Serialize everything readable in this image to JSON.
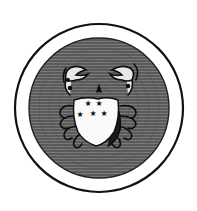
{
  "image": {
    "subject": "Engraved emblem of a crab (Cancer) holding a shield with five stars, inside a circular frame",
    "colors": {
      "background": "#ffffff",
      "ring_stroke": "#111111",
      "disc_fill": "#6e6e6e",
      "hatch": "#3c3c3c",
      "crab_light": "#e8e8e8",
      "shield": "#fafafa",
      "ink": "#0d0d0d"
    },
    "frame": {
      "cx": 99,
      "cy": 108,
      "outer_r": 85,
      "inner_r": 70
    },
    "shield": {
      "stars": 5
    }
  }
}
